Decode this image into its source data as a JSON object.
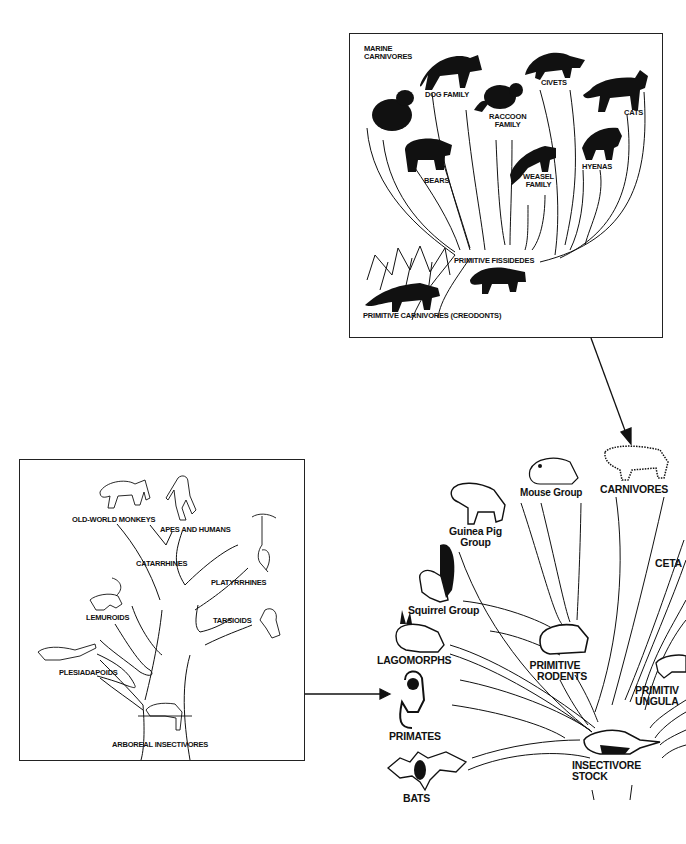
{
  "carnivore_panel": {
    "title_hint": "Carnivore family tree",
    "labels": {
      "marine": [
        "MARINE",
        "CARNIVORES"
      ],
      "dog": "DOG FAMILY",
      "raccoon": [
        "RACCOON",
        "FAMILY"
      ],
      "civets": "CIVETS",
      "cats": "CATS",
      "bears": "BEARS",
      "weasel": [
        "WEASEL",
        "FAMILY"
      ],
      "hyenas": "HYENAS",
      "fissipedes": "PRIMITIVE FISSIDEDES",
      "creodonts": "PRIMITIVE CARNIVORES (CREODONTS)"
    },
    "icons": [
      "walrus-icon",
      "fox-icon",
      "raccoon-icon",
      "civet-icon",
      "cat-icon",
      "bear-icon",
      "weasel-icon",
      "hyena-icon",
      "creodont-icon",
      "fissiped-icon"
    ]
  },
  "primate_panel": {
    "title_hint": "Primate family tree",
    "labels": {
      "old_world": "OLD-WORLD MONKEYS",
      "apes": "APES AND HUMANS",
      "catarrhines": "CATARRHINES",
      "platyrrhines": "PLATYRRHINES",
      "lemuroids": "LEMUROIDS",
      "tarsioids": "TARSIOIDS",
      "plesiadapoids": "PLESIADAPOIDS",
      "arboreal": "ARBOREAL INSECTIVORES"
    },
    "icons": [
      "baboon-icon",
      "ape-icon",
      "spider-monkey-icon",
      "lemur-icon",
      "tarsier-icon",
      "plesiadapid-icon",
      "tree-shrew-icon"
    ]
  },
  "mammal_radiation": {
    "title_hint": "Mammal radiation from insectivore stock",
    "labels": {
      "mouse": "Mouse Group",
      "carnivores": "CARNIVORES",
      "guinea_pig": [
        "Guinea Pig",
        "Group"
      ],
      "cetaceans_partial": "CETA",
      "squirrel": "Squirrel Group",
      "lagomorphs": "LAGOMORPHS",
      "primitive_rodents": [
        "PRIMITIVE",
        "RODENTS"
      ],
      "primitive_ungulates_partial": [
        "PRIMITIV",
        "UNGULA"
      ],
      "primates": "PRIMATES",
      "insectivore": [
        "INSECTIVORE",
        "STOCK"
      ],
      "bats": "BATS"
    },
    "icons": [
      "mouse-icon",
      "leopard-icon",
      "guinea-pig-icon",
      "squirrel-icon",
      "rabbit-icon",
      "rodent-icon",
      "ungulate-icon",
      "monkey-icon",
      "shrew-icon",
      "bat-icon"
    ]
  },
  "arrows": [
    {
      "from": "carnivore_panel",
      "to": "CARNIVORES",
      "direction": "down"
    },
    {
      "from": "primate_panel",
      "to": "PRIMATES",
      "direction": "right"
    }
  ],
  "colors": {
    "ink": "#111111",
    "background": "#ffffff",
    "border": "#222222"
  }
}
